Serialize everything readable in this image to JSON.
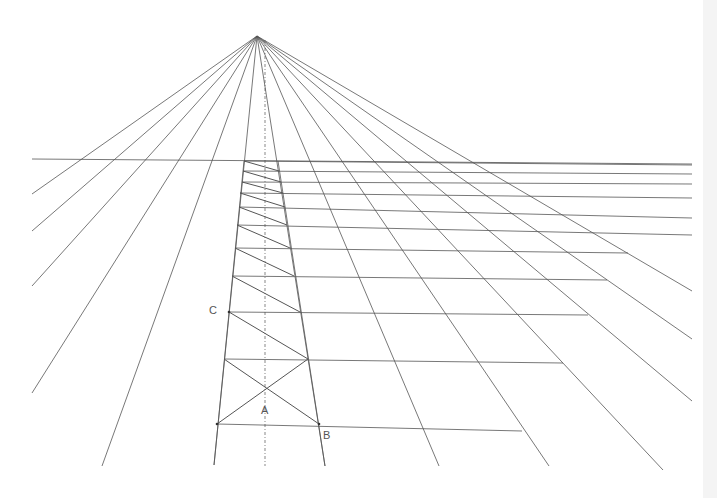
{
  "diagram": {
    "type": "one-point perspective grid construction",
    "vanishing_point": {
      "x": 257,
      "y": 36
    },
    "horizon": {
      "x1": 32,
      "y1": 159,
      "x2": 692,
      "y2": 164
    },
    "rays": [
      {
        "x": 32,
        "y": 194
      },
      {
        "x": 32,
        "y": 231
      },
      {
        "x": 32,
        "y": 286
      },
      {
        "x": 32,
        "y": 393
      },
      {
        "x": 102,
        "y": 466
      },
      {
        "x": 214,
        "y": 465
      },
      {
        "x": 325,
        "y": 466
      },
      {
        "x": 439,
        "y": 466
      },
      {
        "x": 549,
        "y": 466
      },
      {
        "x": 663,
        "y": 470
      },
      {
        "x": 692,
        "y": 401
      },
      {
        "x": 692,
        "y": 339
      },
      {
        "x": 692,
        "y": 291
      }
    ],
    "strip_left": [
      {
        "x": 244,
        "y": 161
      },
      {
        "x": 217,
        "y": 424
      }
    ],
    "strip_right": [
      {
        "x": 278,
        "y": 161
      },
      {
        "x": 319,
        "y": 426
      }
    ],
    "rows": [
      {
        "y": 161,
        "xl": 244,
        "xr": 278,
        "xend": 692,
        "yend": 165
      },
      {
        "y": 171,
        "xl": 243,
        "xr": 279,
        "xend": 692,
        "yend": 174
      },
      {
        "y": 182,
        "xl": 242,
        "xr": 281,
        "xend": 692,
        "yend": 184
      },
      {
        "y": 193,
        "xl": 240,
        "xr": 283,
        "xend": 692,
        "yend": 198
      },
      {
        "y": 207,
        "xl": 239,
        "xr": 285,
        "xend": 692,
        "yend": 218
      },
      {
        "y": 225,
        "xl": 237,
        "xr": 287,
        "xend": 692,
        "yend": 235
      },
      {
        "y": 248,
        "xl": 235,
        "xr": 290,
        "xend": 628,
        "yend": 253
      },
      {
        "y": 276,
        "xl": 232,
        "xr": 294,
        "xend": 607,
        "yend": 280
      },
      {
        "y": 312,
        "xl": 229,
        "xr": 300,
        "xend": 588,
        "yend": 315
      },
      {
        "y": 359,
        "xl": 224,
        "xr": 308,
        "xend": 563,
        "yend": 363
      },
      {
        "y": 424,
        "xl": 217,
        "xr": 319,
        "xend": 522,
        "yend": 431
      }
    ],
    "center_line": {
      "x": 265,
      "y1": 40,
      "y2": 466
    },
    "labels": [
      {
        "id": "C",
        "text": "C",
        "x": 209,
        "y": 304
      },
      {
        "id": "A",
        "text": "A",
        "x": 261,
        "y": 404
      },
      {
        "id": "B",
        "text": "B",
        "x": 323,
        "y": 429
      }
    ],
    "line_color": "#555555"
  }
}
